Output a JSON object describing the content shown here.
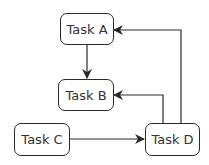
{
  "diagram": {
    "nodes": [
      {
        "id": "A",
        "label": "Task A"
      },
      {
        "id": "B",
        "label": "Task B"
      },
      {
        "id": "C",
        "label": "Task C"
      },
      {
        "id": "D",
        "label": "Task D"
      }
    ],
    "edges": [
      {
        "from": "A",
        "to": "B"
      },
      {
        "from": "C",
        "to": "D"
      },
      {
        "from": "D",
        "to": "B"
      },
      {
        "from": "D",
        "to": "A"
      }
    ]
  }
}
